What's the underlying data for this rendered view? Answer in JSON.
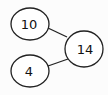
{
  "diagram": {
    "type": "number-bond",
    "whole": {
      "label": "14"
    },
    "parts": [
      {
        "label": "10"
      },
      {
        "label": "4"
      }
    ],
    "colors": {
      "stroke": "#222222",
      "fill": "#ffffff",
      "background": "#fcfcfc"
    }
  }
}
